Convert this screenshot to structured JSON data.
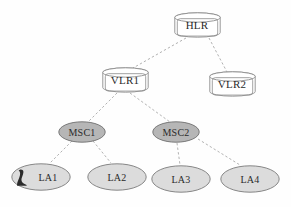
{
  "diagram": {
    "background_color": "#fefefe",
    "edge_color": "#a9a9a9",
    "edge_style": "dashed",
    "nodes": [
      {
        "id": "hlr",
        "label": "HLR",
        "shape": "cylinder",
        "fill": "#ffffff",
        "stroke": "#8c8c8c",
        "cx": 197,
        "cy": 25,
        "w": 47,
        "h": 26
      },
      {
        "id": "vlr1",
        "label": "VLR1",
        "shape": "cylinder",
        "fill": "#ffffff",
        "stroke": "#8c8c8c",
        "cx": 125,
        "cy": 80,
        "w": 47,
        "h": 26
      },
      {
        "id": "vlr2",
        "label": "VLR2",
        "shape": "cylinder",
        "fill": "#ffffff",
        "stroke": "#8c8c8c",
        "cx": 232,
        "cy": 84,
        "w": 47,
        "h": 26
      },
      {
        "id": "msc1",
        "label": "MSC1",
        "shape": "ellipse",
        "fill": "#b6b6b6",
        "stroke": "#6e6e6e",
        "cx": 82,
        "cy": 132,
        "w": 48,
        "h": 22
      },
      {
        "id": "msc2",
        "label": "MSC2",
        "shape": "ellipse",
        "fill": "#b6b6b6",
        "stroke": "#6e6e6e",
        "cx": 176,
        "cy": 132,
        "w": 48,
        "h": 22
      },
      {
        "id": "la1",
        "label": "LA1",
        "shape": "ellipse",
        "fill": "#dcdcdc",
        "stroke": "#7a7a7a",
        "cx": 41,
        "cy": 177,
        "w": 60,
        "h": 28,
        "device_icon": "mobile-handset-icon"
      },
      {
        "id": "la2",
        "label": "LA2",
        "shape": "ellipse",
        "fill": "#dcdcdc",
        "stroke": "#7a7a7a",
        "cx": 117,
        "cy": 177,
        "w": 60,
        "h": 28
      },
      {
        "id": "la3",
        "label": "LA3",
        "shape": "ellipse",
        "fill": "#dcdcdc",
        "stroke": "#7a7a7a",
        "cx": 181,
        "cy": 179,
        "w": 60,
        "h": 28
      },
      {
        "id": "la4",
        "label": "LA4",
        "shape": "ellipse",
        "fill": "#dcdcdc",
        "stroke": "#7a7a7a",
        "cx": 250,
        "cy": 179,
        "w": 60,
        "h": 28
      }
    ],
    "edges": [
      {
        "from": "hlr",
        "to": "vlr1",
        "x1": 186,
        "y1": 38,
        "x2": 133,
        "y2": 68
      },
      {
        "from": "hlr",
        "to": "vlr2",
        "x1": 209,
        "y1": 38,
        "x2": 227,
        "y2": 72
      },
      {
        "from": "vlr1",
        "to": "msc1",
        "x1": 117,
        "y1": 93,
        "x2": 88,
        "y2": 122
      },
      {
        "from": "vlr1",
        "to": "msc2",
        "x1": 130,
        "y1": 93,
        "x2": 170,
        "y2": 122
      },
      {
        "from": "msc1",
        "to": "la1",
        "x1": 72,
        "y1": 141,
        "x2": 50,
        "y2": 163
      },
      {
        "from": "msc1",
        "to": "la2",
        "x1": 93,
        "y1": 141,
        "x2": 111,
        "y2": 163
      },
      {
        "from": "msc2",
        "to": "la3",
        "x1": 177,
        "y1": 143,
        "x2": 180,
        "y2": 165
      },
      {
        "from": "msc2",
        "to": "la4",
        "x1": 198,
        "y1": 139,
        "x2": 240,
        "y2": 165
      }
    ]
  }
}
